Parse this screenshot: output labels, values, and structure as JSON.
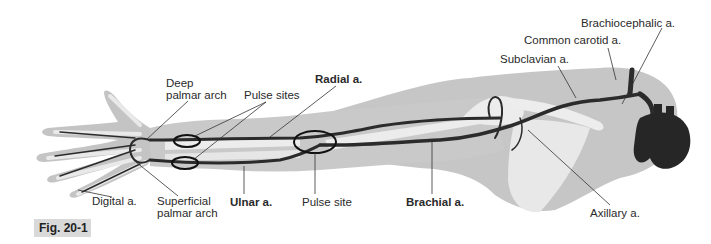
{
  "figure": {
    "tag": "Fig. 20-1",
    "colors": {
      "skin": "#c9c9c9",
      "skin_dark": "#b3b3b3",
      "bone": "#ececec",
      "artery": "#2b2b2b",
      "leader_line": "#333333",
      "pulse_ring": "#111111",
      "tag_bg": "#d9d9d9"
    }
  },
  "labels": {
    "deep_palmar_arch": [
      "Deep",
      "palmar arch"
    ],
    "pulse_sites": "Pulse sites",
    "radial": "Radial a.",
    "brachiocephalic": "Brachiocephalic a.",
    "common_carotid": "Common carotid a.",
    "subclavian": "Subclavian a.",
    "digital": "Digital a.",
    "superficial_palmar_arch": [
      "Superficial",
      "palmar arch"
    ],
    "ulnar": "Ulnar a.",
    "pulse_site": "Pulse site",
    "brachial": "Brachial a.",
    "axillary": "Axillary a."
  },
  "pulse_markers": [
    {
      "name": "radial-wrist-pulse",
      "cx": 187,
      "cy": 141
    },
    {
      "name": "ulnar-wrist-pulse",
      "cx": 185,
      "cy": 163
    },
    {
      "name": "brachial-elbow-pulse",
      "cx": 315,
      "cy": 142
    }
  ]
}
